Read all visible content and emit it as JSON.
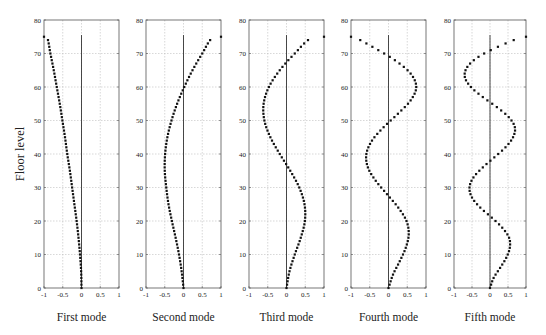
{
  "chart_data": {
    "type": "scatter",
    "ylabel": "Floor level",
    "xlim": [
      -1,
      1
    ],
    "ylim": [
      0,
      80
    ],
    "xticks": [
      -1,
      -0.5,
      0,
      0.5,
      1
    ],
    "xtick_labels": [
      "-1",
      "-0.5",
      "0",
      "0.5",
      "1"
    ],
    "yticks": [
      0,
      10,
      20,
      30,
      40,
      50,
      60,
      70,
      80
    ],
    "ytick_labels": [
      "0",
      "10",
      "20",
      "30",
      "40",
      "50",
      "60",
      "70",
      "80"
    ],
    "grid": true,
    "floors": {
      "from": 0,
      "to": 75
    },
    "reference_line": {
      "x": 0,
      "from_floor": 0,
      "to_floor": 75.5
    },
    "panels": [
      {
        "name": "First mode",
        "control_points": [
          [
            0,
            0
          ],
          [
            5,
            -0.01
          ],
          [
            10,
            -0.04
          ],
          [
            15,
            -0.08
          ],
          [
            20,
            -0.13
          ],
          [
            25,
            -0.19
          ],
          [
            30,
            -0.25
          ],
          [
            35,
            -0.31
          ],
          [
            40,
            -0.38
          ],
          [
            45,
            -0.44
          ],
          [
            50,
            -0.51
          ],
          [
            55,
            -0.58
          ],
          [
            60,
            -0.66
          ],
          [
            65,
            -0.74
          ],
          [
            70,
            -0.83
          ],
          [
            75,
            -0.92
          ],
          [
            75.5,
            -1.0
          ]
        ]
      },
      {
        "name": "Second mode",
        "control_points": [
          [
            0,
            0
          ],
          [
            5,
            -0.05
          ],
          [
            10,
            -0.12
          ],
          [
            15,
            -0.21
          ],
          [
            20,
            -0.31
          ],
          [
            25,
            -0.4
          ],
          [
            30,
            -0.46
          ],
          [
            35,
            -0.5
          ],
          [
            40,
            -0.49
          ],
          [
            45,
            -0.43
          ],
          [
            50,
            -0.32
          ],
          [
            55,
            -0.17
          ],
          [
            60,
            0.02
          ],
          [
            65,
            0.24
          ],
          [
            70,
            0.5
          ],
          [
            75,
            0.79
          ],
          [
            75.5,
            1.0
          ]
        ]
      },
      {
        "name": "Third mode",
        "control_points": [
          [
            0,
            0
          ],
          [
            5,
            0.08
          ],
          [
            10,
            0.22
          ],
          [
            15,
            0.38
          ],
          [
            20,
            0.49
          ],
          [
            25,
            0.48
          ],
          [
            30,
            0.34
          ],
          [
            35,
            0.1
          ],
          [
            40,
            -0.18
          ],
          [
            45,
            -0.43
          ],
          [
            50,
            -0.59
          ],
          [
            55,
            -0.61
          ],
          [
            60,
            -0.47
          ],
          [
            65,
            -0.18
          ],
          [
            70,
            0.22
          ],
          [
            75,
            0.7
          ],
          [
            75.5,
            1.0
          ]
        ]
      },
      {
        "name": "Fourth mode",
        "control_points": [
          [
            0,
            0
          ],
          [
            4,
            0.12
          ],
          [
            8,
            0.3
          ],
          [
            12,
            0.46
          ],
          [
            16,
            0.54
          ],
          [
            20,
            0.48
          ],
          [
            24,
            0.26
          ],
          [
            28,
            -0.04
          ],
          [
            32,
            -0.34
          ],
          [
            36,
            -0.55
          ],
          [
            40,
            -0.59
          ],
          [
            44,
            -0.44
          ],
          [
            48,
            -0.13
          ],
          [
            52,
            0.25
          ],
          [
            56,
            0.59
          ],
          [
            60,
            0.74
          ],
          [
            64,
            0.59
          ],
          [
            68,
            0.17
          ],
          [
            72,
            -0.43
          ],
          [
            75.5,
            -1.0
          ]
        ]
      },
      {
        "name": "Fifth mode",
        "control_points": [
          [
            0,
            0
          ],
          [
            3,
            0.1
          ],
          [
            6,
            0.28
          ],
          [
            9,
            0.45
          ],
          [
            12,
            0.55
          ],
          [
            15,
            0.53
          ],
          [
            18,
            0.34
          ],
          [
            21,
            0.05
          ],
          [
            24,
            -0.27
          ],
          [
            27,
            -0.5
          ],
          [
            30,
            -0.57
          ],
          [
            33,
            -0.46
          ],
          [
            36,
            -0.2
          ],
          [
            39,
            0.12
          ],
          [
            42,
            0.43
          ],
          [
            45,
            0.64
          ],
          [
            48,
            0.69
          ],
          [
            51,
            0.52
          ],
          [
            54,
            0.19
          ],
          [
            57,
            -0.2
          ],
          [
            60,
            -0.53
          ],
          [
            63,
            -0.7
          ],
          [
            66,
            -0.63
          ],
          [
            69,
            -0.32
          ],
          [
            72,
            0.22
          ],
          [
            75.5,
            1.0
          ]
        ]
      }
    ]
  }
}
